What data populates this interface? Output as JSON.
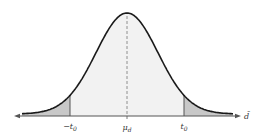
{
  "figure": {
    "type": "normal-distribution-two-tailed"
  },
  "geometry": {
    "width": 263,
    "height": 138,
    "center_x": 127,
    "axis_y": 116,
    "peak_y": 14,
    "sigma_px": 31,
    "x_min": 22,
    "x_max": 233,
    "cut_left_x": 70,
    "cut_right_x": 184,
    "axis_left_x": 14,
    "axis_right_x": 241
  },
  "colors": {
    "curve": "#1a1a1a",
    "body_fill": "#f2f2f2",
    "tail_fill": "#c8c8c8",
    "axis": "#555555",
    "dashed": "#777777",
    "cutoff_line": "#555555",
    "text": "#333333"
  },
  "labels": {
    "left_cutoff": {
      "main": "−t",
      "sub": "0"
    },
    "mean": {
      "main": "μ",
      "sub": "d"
    },
    "right_cutoff": {
      "main": "t",
      "sub": "0"
    },
    "axis_variable": "d̄"
  }
}
